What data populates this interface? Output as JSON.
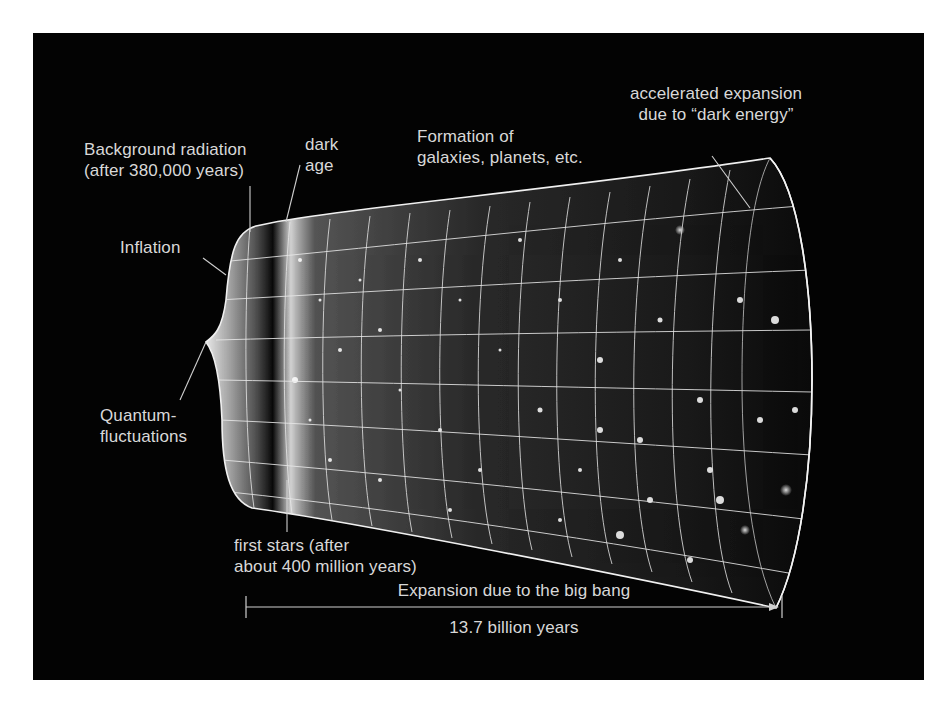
{
  "figure": {
    "colors": {
      "background": "#ffffff",
      "panel": "#030303",
      "label_text": "#d8d8d8",
      "grid": "#e8e8e8"
    }
  },
  "labels": {
    "background_radiation": {
      "line1": "Background radiation",
      "line2": "(after 380,000 years)"
    },
    "dark_age": {
      "line1": "dark",
      "line2": "age"
    },
    "formation": {
      "line1": "Formation of",
      "line2": "galaxies, planets, etc."
    },
    "accelerated": {
      "line1": "accelerated expansion",
      "line2": "due to “dark energy”"
    },
    "inflation": {
      "line1": "Inflation"
    },
    "quantum": {
      "line1": "Quantum-",
      "line2": "fluctuations"
    },
    "first_stars": {
      "line1": "first stars (after",
      "line2": "about 400 million years)"
    },
    "expansion_axis": {
      "top": "Expansion due to the big bang",
      "bottom": "13.7 billion years"
    }
  }
}
